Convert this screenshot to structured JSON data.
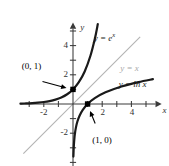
{
  "chart_data": {
    "type": "line",
    "title": "",
    "xlabel": "x",
    "ylabel": "y",
    "xlim": [
      -3.6,
      6.2
    ],
    "ylim": [
      -4.4,
      5.6
    ],
    "grid": false,
    "legend_position": "inline-curve-labels",
    "x_ticks": [
      -3,
      -2,
      -1,
      1,
      2,
      3,
      4,
      5
    ],
    "x_tick_labels": [
      "",
      "-2",
      "",
      "",
      "2",
      "",
      "4",
      ""
    ],
    "y_ticks": [
      -4,
      -3,
      -2,
      -1,
      1,
      2,
      3,
      4,
      5
    ],
    "y_tick_labels": [
      "",
      "",
      "-2",
      "",
      "",
      "2",
      "",
      "4",
      ""
    ],
    "series": [
      {
        "name": "y = e^x",
        "label": "y = e",
        "label_sup": "x",
        "color": "#1a1a1a",
        "equation": "y = e^x",
        "points": [
          [
            -3.6,
            0.027
          ],
          [
            -3.2,
            0.041
          ],
          [
            -2.8,
            0.061
          ],
          [
            -2.4,
            0.091
          ],
          [
            -2.0,
            0.135
          ],
          [
            -1.6,
            0.202
          ],
          [
            -1.2,
            0.301
          ],
          [
            -0.8,
            0.449
          ],
          [
            -0.4,
            0.67
          ],
          [
            0.0,
            1.0
          ],
          [
            0.4,
            1.492
          ],
          [
            0.8,
            2.226
          ],
          [
            1.2,
            3.32
          ],
          [
            1.5,
            4.482
          ],
          [
            1.7,
            5.474
          ]
        ]
      },
      {
        "name": "y = ln x",
        "label": "y = ln x",
        "color": "#1a1a1a",
        "equation": "y = ln x",
        "points": [
          [
            0.027,
            -3.6
          ],
          [
            0.041,
            -3.2
          ],
          [
            0.061,
            -2.8
          ],
          [
            0.091,
            -2.4
          ],
          [
            0.135,
            -2.0
          ],
          [
            0.202,
            -1.6
          ],
          [
            0.301,
            -1.2
          ],
          [
            0.449,
            -0.8
          ],
          [
            0.67,
            -0.4
          ],
          [
            1.0,
            0.0
          ],
          [
            1.492,
            0.4
          ],
          [
            2.226,
            0.8
          ],
          [
            3.32,
            1.2
          ],
          [
            4.482,
            1.5
          ],
          [
            5.474,
            1.7
          ]
        ]
      },
      {
        "name": "y = x",
        "label": "y = x",
        "color": "#b4b4b4",
        "equation": "y = x",
        "points": [
          [
            -3.4,
            -3.4
          ],
          [
            4.6,
            4.6
          ]
        ]
      }
    ],
    "annotations": [
      {
        "name": "point-0-1",
        "label": "(0, 1)",
        "point": [
          0,
          1
        ],
        "label_position": [
          -3.3,
          2.55
        ],
        "marker": "square",
        "marker_color": "#000000"
      },
      {
        "name": "point-1-0",
        "label": "(1, 0)",
        "point": [
          1,
          0
        ],
        "label_position": [
          1.25,
          -2.55
        ],
        "marker": "square",
        "marker_color": "#000000"
      }
    ],
    "curve_label_positions": {
      "exp": [
        1.35,
        4.55
      ],
      "identity": [
        3.3,
        2.5
      ],
      "log": [
        3.2,
        1.35
      ]
    },
    "axis_label_positions": {
      "x": [
        6.0,
        -0.45
      ],
      "y": [
        0.42,
        5.3
      ]
    }
  }
}
